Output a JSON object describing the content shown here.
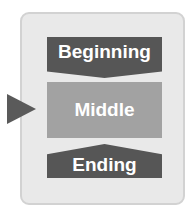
{
  "diagram": {
    "type": "story-structure-stages",
    "stages": [
      {
        "label": "Beginning",
        "shape": "down-chevron-box",
        "color": "#565656"
      },
      {
        "label": "Middle",
        "shape": "rectangle",
        "color": "#a2a2a2",
        "highlighted": true
      },
      {
        "label": "Ending",
        "shape": "up-chevron-box",
        "color": "#565656"
      }
    ],
    "pointer": {
      "target": "Middle",
      "color": "#5a5a5a"
    },
    "container_color": "#e9e9e9"
  }
}
